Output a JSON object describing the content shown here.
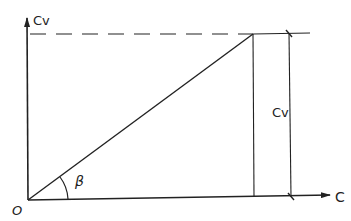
{
  "diagram": {
    "origin_label": "O",
    "y_axis_label": "Cv",
    "x_axis_label": "C",
    "angle_label": "β",
    "dimension_label": "Cv",
    "colors": {
      "stroke": "#222222",
      "background": "#ffffff"
    }
  }
}
